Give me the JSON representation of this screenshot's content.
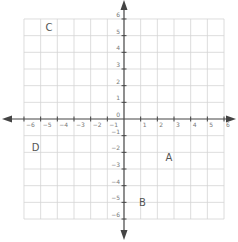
{
  "diagram": {
    "type": "coordinate-plane",
    "x_range": [
      -6,
      6
    ],
    "y_range": [
      -6,
      6
    ],
    "grid_step": 1,
    "x_tick_labels": [
      "-6",
      "-5",
      "-4",
      "-3",
      "-2",
      "-1",
      "1",
      "2",
      "3",
      "4",
      "5",
      "6"
    ],
    "y_tick_labels": [
      "6",
      "5",
      "4",
      "3",
      "2",
      "1",
      "0",
      "-1",
      "-2",
      "-3",
      "-4",
      "-5",
      "-6"
    ],
    "origin_label": "0",
    "points": [
      {
        "label": "A",
        "x": 2.7,
        "y": -2.3
      },
      {
        "label": "B",
        "x": 1.1,
        "y": -5.0
      },
      {
        "label": "C",
        "x": -4.5,
        "y": 5.5
      },
      {
        "label": "D",
        "x": -5.3,
        "y": -1.7
      }
    ],
    "colors": {
      "grid": "#d4d4d4",
      "axis": "#444444",
      "tick_label": "#777777",
      "point_label": "#555555"
    }
  }
}
